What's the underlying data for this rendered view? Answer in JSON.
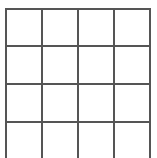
{
  "grid": {
    "columns": 4,
    "rows_visible": 4,
    "line_color": "#555555",
    "background": "#ffffff",
    "x_lines": [
      6,
      42,
      78,
      114,
      150
    ],
    "y_lines": [
      9,
      46,
      84,
      122
    ],
    "bottom_open": true
  }
}
